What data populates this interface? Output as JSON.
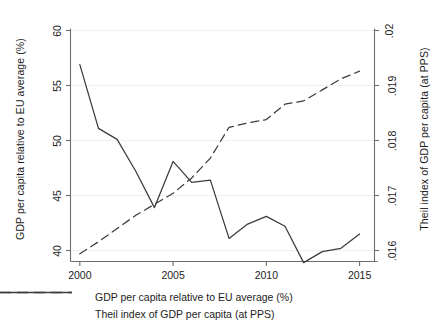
{
  "chart_data": {
    "type": "line",
    "title": "",
    "xlabel": "",
    "ylabel": "GDP per capita relative to EU average (%)",
    "ylabel_right": "Theil index of GDP per capita (at PPS)",
    "x": [
      2000,
      2001,
      2002,
      2003,
      2004,
      2005,
      2006,
      2007,
      2008,
      2009,
      2010,
      2011,
      2012,
      2013,
      2014,
      2015
    ],
    "xlim": [
      1999.5,
      2015.8
    ],
    "xticks": [
      2000,
      2005,
      2010,
      2015
    ],
    "xtick_labels": [
      "2000",
      "2005",
      "2010",
      "2015"
    ],
    "ylim": [
      39.0,
      60.0
    ],
    "yticks": [
      40,
      45,
      50,
      55,
      60
    ],
    "ytick_labels": [
      "40",
      "45",
      "50",
      "55",
      "60"
    ],
    "ylim_right": [
      0.0158,
      0.02
    ],
    "yticks_right": [
      0.016,
      0.017,
      0.018,
      0.019,
      0.02
    ],
    "ytick_labels_right": [
      ".016",
      ".017",
      ".018",
      ".019",
      ".02"
    ],
    "grid": "faint horizontal gridlines",
    "legend_position": "below axes, centered",
    "series": [
      {
        "name": "GDP per capita relative to EU average (%)",
        "axis": "left",
        "style": "dashed",
        "color": "#3c3c3c",
        "values": [
          39.7,
          40.8,
          42.0,
          43.2,
          44.2,
          45.2,
          46.6,
          48.4,
          51.2,
          51.6,
          51.9,
          53.3,
          53.6,
          54.6,
          55.6,
          56.3
        ]
      },
      {
        "name": "Theil index of GDP per capita (at PPS)",
        "axis": "right",
        "style": "solid",
        "color": "#3c3c3c",
        "values": [
          0.01938,
          0.01822,
          0.01802,
          0.01744,
          0.01678,
          0.01762,
          0.01724,
          0.01728,
          0.01622,
          0.01648,
          0.01662,
          0.01644,
          0.01578,
          0.01598,
          0.01604,
          0.0163
        ]
      }
    ]
  },
  "legend": {
    "items": [
      {
        "label": "GDP per capita relative to EU average (%)",
        "style": "dashed"
      },
      {
        "label": "Theil index of GDP per capita (at PPS)",
        "style": "solid"
      }
    ]
  }
}
